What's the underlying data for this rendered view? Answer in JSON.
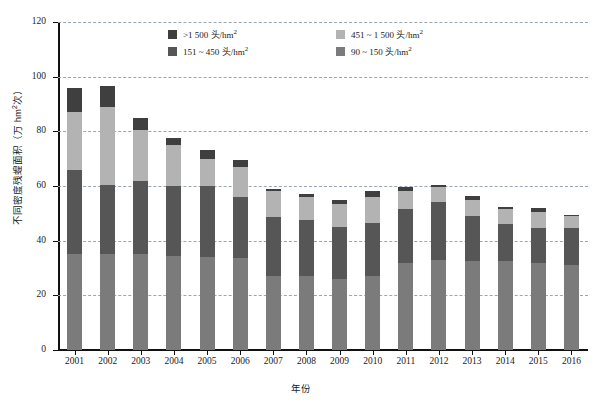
{
  "chart_data": {
    "type": "bar",
    "stacked": true,
    "title": "",
    "xlabel": "年份",
    "ylabel": "不同密度残蝗面积（万 hm²次）",
    "categories": [
      "2001",
      "2002",
      "2003",
      "2004",
      "2005",
      "2006",
      "2007",
      "2008",
      "2009",
      "2010",
      "2011",
      "2012",
      "2013",
      "2014",
      "2015",
      "2016"
    ],
    "ylim": [
      0,
      120
    ],
    "ytick_values": [
      0,
      20,
      40,
      60,
      80,
      100,
      120
    ],
    "ytick_labels": [
      "0",
      "20",
      "40",
      "60",
      "80",
      "100",
      "120"
    ],
    "grid": true,
    "legend_position": "top-center",
    "series": [
      {
        "name": "90 ~ 150 头/hm²",
        "color": "#7b7b7b",
        "values": [
          35,
          35,
          35,
          34.5,
          34,
          33.5,
          27,
          27,
          26,
          27,
          32,
          33,
          32.5,
          32.5,
          32,
          31
        ]
      },
      {
        "name": "151 ~ 450 头/hm²",
        "color": "#565656",
        "values": [
          31,
          25.5,
          27,
          25.5,
          26,
          22.5,
          21.5,
          20.5,
          19,
          19.5,
          19.5,
          21,
          16.5,
          13.5,
          12.5,
          13.5
        ]
      },
      {
        "name": "451 ~ 1 500 头/hm²",
        "color": "#b3b3b3",
        "values": [
          21,
          28.5,
          18.5,
          15,
          10,
          11,
          9.5,
          8.5,
          8.5,
          9.5,
          6.5,
          5.5,
          6,
          5.5,
          6,
          4.5
        ]
      },
      {
        "name": ">1 500 头/hm²",
        "color": "#3f3f3f",
        "values": [
          9,
          7.5,
          4.5,
          2.5,
          3,
          2.5,
          1,
          1,
          1.5,
          2,
          1.5,
          1,
          1.5,
          1,
          1.5,
          0.5
        ]
      }
    ]
  },
  "legend": {
    "items": [
      {
        "label_prefix": ">1 500 ",
        "label_unit": "头/hm",
        "sup": "2",
        "color": "#3f3f3f",
        "name": "gt-1500"
      },
      {
        "label_prefix": "451 ~ 1 500 ",
        "label_unit": "头/hm",
        "sup": "2",
        "color": "#b3b3b3",
        "name": "451-1500"
      },
      {
        "label_prefix": "151 ~ 450 ",
        "label_unit": "头/hm",
        "sup": "2",
        "color": "#565656",
        "name": "151-450"
      },
      {
        "label_prefix": "90 ~ 150 ",
        "label_unit": "头/hm",
        "sup": "2",
        "color": "#7b7b7b",
        "name": "90-150"
      }
    ]
  },
  "axis": {
    "y_title_main": "不同密度残蝗面积（万 hm",
    "y_title_sup": "2",
    "y_title_tail": "次）",
    "x_title": "年份"
  },
  "colors": {
    "grid": "#9aa7b2",
    "axis": "#111111",
    "background": "#ffffff"
  }
}
